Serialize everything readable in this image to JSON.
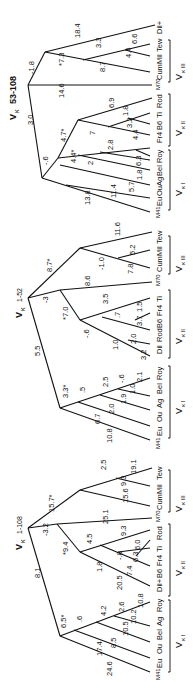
{
  "figure": {
    "orientation": "rotated 90 degrees counter-clockwise",
    "trees": [
      {
        "title": {
          "v": "V",
          "sub": "κ",
          "id": "53-108"
        },
        "groups": [
          {
            "label": "Vκ I",
            "v": "V",
            "sub": "κ I",
            "taxa": [
              "Eu",
              "Ou",
              "Ag",
              "Bel",
              "Roy"
            ]
          },
          {
            "label": "Vκ II",
            "v": "V",
            "sub": "κ II",
            "taxa": [
              "Fr4",
              "B6",
              "Ti",
              "Rod"
            ]
          },
          {
            "label": "Vκ III",
            "v": "V",
            "sub": "κ III",
            "taxa": [
              "Cum",
              "Mil",
              "Tew"
            ]
          }
        ],
        "outgroups": [
          "M41",
          "M70",
          "Dil+"
        ],
        "branch_lengths": [
          "3.0",
          "-1.8",
          "18.4",
          "*7.3",
          "3.3",
          "6.6",
          "8.7",
          "4.4",
          "14.6",
          "-.6",
          "4.7*",
          "6.9",
          "1.8",
          "7",
          "3.2",
          "4.4",
          "2",
          "2.8",
          "6.3",
          "3.7",
          "1.8",
          "5.7",
          "5",
          "11.4",
          "4.4*",
          "13.8"
        ]
      },
      {
        "title": {
          "v": "V",
          "sub": "κ",
          "id": "1-52"
        },
        "groups": [
          {
            "label": "Vκ I",
            "v": "V",
            "sub": "κ I",
            "taxa": [
              "Eu",
              "Ou",
              "Ag",
              "Bel",
              "Roy"
            ]
          },
          {
            "label": "Vκ II",
            "v": "V",
            "sub": "κ II",
            "taxa": [
              "Dil",
              "Rod",
              "B6",
              "Fr4",
              "Ti"
            ]
          },
          {
            "label": "Vκ III",
            "v": "V",
            "sub": "κ III",
            "taxa": [
              "Cum",
              "Mil",
              "Tew"
            ]
          }
        ],
        "outgroups": [
          "M41",
          "M70"
        ],
        "branch_lengths": [
          "8.7*",
          "11.6",
          "-1.0",
          "5.2",
          "7.8",
          "8.6",
          "-3",
          "*7.0",
          "3.5",
          "-.6",
          ".7",
          "1.5",
          "3.7",
          "1.0",
          "2.0",
          "3.2",
          "5.5",
          "3.3*",
          ".5",
          "2.5",
          "-.6",
          "2.1",
          "1.0",
          "1.9",
          "2.0",
          "6.7",
          "10.8"
        ]
      },
      {
        "title": {
          "v": "V",
          "sub": "κ",
          "id": "1-108"
        },
        "groups": [
          {
            "label": "Vκ I",
            "v": "V",
            "sub": "κ I",
            "taxa": [
              "Eu",
              "Ou",
              "Bel",
              "Ag",
              "Roy"
            ]
          },
          {
            "label": "Vκ II",
            "v": "V",
            "sub": "κ II",
            "taxa": [
              "Dil+",
              "B6",
              "Fr4",
              "Ti",
              "Rod"
            ]
          },
          {
            "label": "Vκ III",
            "v": "V",
            "sub": "κ III",
            "taxa": [
              "Cum",
              "Mil",
              "Tew"
            ]
          }
        ],
        "outgroups": [
          "M41",
          "M70"
        ],
        "branch_lengths": [
          "15.7*",
          "2.5",
          "19.1",
          "9.3",
          "15.6",
          "25.1",
          "-3.2",
          "*9.4",
          "4.5",
          "9.3",
          "6.0",
          "-.8",
          "6.3",
          "1.8",
          "7.4",
          "20.5",
          "8.1",
          "6.5*",
          ".6",
          "4.2",
          "2.6",
          "10.8",
          "10.2",
          "10.5",
          "8.5",
          "17.4",
          "24.6"
        ]
      }
    ]
  }
}
